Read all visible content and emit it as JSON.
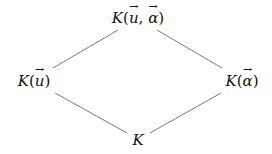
{
  "diagram": {
    "type": "lattice",
    "nodes": [
      {
        "id": "top",
        "label": "K(u⃗, α⃗)",
        "field": "K",
        "vars": [
          "u",
          "α"
        ],
        "x": 138,
        "y": 18
      },
      {
        "id": "left",
        "label": "K(u⃗)",
        "field": "K",
        "vars": [
          "u"
        ],
        "x": 34,
        "y": 81
      },
      {
        "id": "right",
        "label": "K(α⃗)",
        "field": "K",
        "vars": [
          "α"
        ],
        "x": 242,
        "y": 81
      },
      {
        "id": "bottom",
        "label": "K",
        "field": "K",
        "vars": [],
        "x": 138,
        "y": 140
      }
    ],
    "edges": [
      {
        "from": "top",
        "to": "left"
      },
      {
        "from": "top",
        "to": "right"
      },
      {
        "from": "left",
        "to": "bottom"
      },
      {
        "from": "right",
        "to": "bottom"
      }
    ],
    "line_color": "#7a7a7a"
  }
}
